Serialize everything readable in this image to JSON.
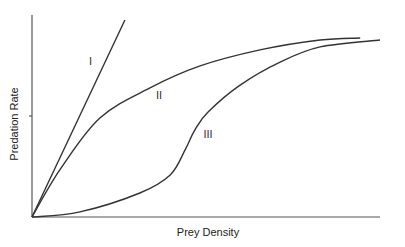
{
  "chart_data": {
    "type": "line",
    "title": "",
    "xlabel": "Prey Density",
    "ylabel": "Predation Rate",
    "xlim": [
      0,
      100
    ],
    "ylim": [
      0,
      100
    ],
    "grid": false,
    "legend": "none",
    "y_ticks": [
      50
    ],
    "series": [
      {
        "name": "I",
        "label": "I",
        "x": [
          0,
          26.7
        ],
        "y": [
          0,
          97.5
        ],
        "label_at": [
          16.8,
          77.2
        ]
      },
      {
        "name": "II",
        "label": "II",
        "x": [
          0,
          8.0,
          19.5,
          33.9,
          48.3,
          65.5,
          82.8,
          94.3
        ],
        "y": [
          0,
          23.3,
          49.0,
          63.9,
          74.8,
          82.7,
          87.6,
          88.6
        ],
        "label_at": [
          36.5,
          60.4
        ]
      },
      {
        "name": "III",
        "label": "III",
        "x": [
          0,
          13.8,
          31.0,
          39.7,
          44.0,
          46.8,
          50.6,
          59.8,
          71.3,
          82.8,
          100
        ],
        "y": [
          0,
          2.5,
          11.9,
          20.8,
          33.2,
          43.1,
          52.0,
          65.3,
          76.7,
          84.2,
          87.6
        ],
        "label_at": [
          50.6,
          41.1
        ]
      }
    ]
  }
}
